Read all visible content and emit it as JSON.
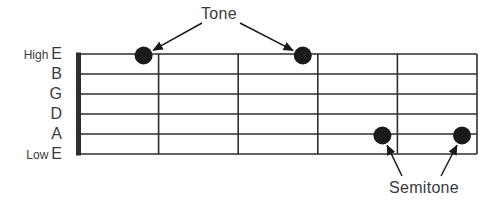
{
  "figure": {
    "type": "guitar-fretboard-diagram",
    "background_color": "#ffffff",
    "line_color": "#2e2e2e",
    "dot_color": "#1a1a1a",
    "text_color": "#3a3a3a"
  },
  "strings": [
    {
      "prefix": "High",
      "note": "E"
    },
    {
      "prefix": "",
      "note": "B"
    },
    {
      "prefix": "",
      "note": "G"
    },
    {
      "prefix": "",
      "note": "D"
    },
    {
      "prefix": "",
      "note": "A"
    },
    {
      "prefix": "Low",
      "note": "E"
    }
  ],
  "fret_count": 5,
  "markers": [
    {
      "string": "High E",
      "string_index": 0,
      "fret": 1,
      "interval": "Tone"
    },
    {
      "string": "High E",
      "string_index": 0,
      "fret": 3,
      "interval": "Tone"
    },
    {
      "string": "A",
      "string_index": 4,
      "fret": 4,
      "interval": "Semitone"
    },
    {
      "string": "A",
      "string_index": 4,
      "fret": 5,
      "interval": "Semitone"
    }
  ],
  "annotations": [
    {
      "label": "Tone",
      "marker_indexes": [
        0,
        1
      ]
    },
    {
      "label": "Semitone",
      "marker_indexes": [
        2,
        3
      ]
    }
  ]
}
